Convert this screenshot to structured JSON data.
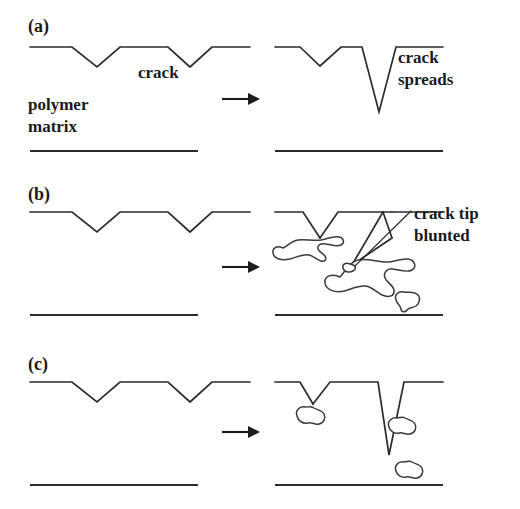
{
  "figure": {
    "background_color": "#ffffff",
    "line_color": "#2b2b2b",
    "text_color": "#1a1a1a",
    "width": 520,
    "height": 509
  },
  "panels": [
    {
      "id": "a",
      "label": "(a)",
      "description": "Unmodified polymer: crack spreads into the matrix",
      "left_labels": [
        "crack",
        "polymer",
        "matrix"
      ],
      "right_labels": [
        "crack",
        "spreads"
      ],
      "has_particles": false
    },
    {
      "id": "b",
      "label": "(b)",
      "description": "Rubber-modified polymer: large particles blunt the crack tip",
      "left_labels": [],
      "right_labels": [
        "crack tip",
        "blunted"
      ],
      "has_particles": true
    },
    {
      "id": "c",
      "label": "(c)",
      "description": "Small rubber particles: crack still spreads",
      "left_labels": [],
      "right_labels": [],
      "has_particles": true
    }
  ],
  "labels": {
    "panel_a": "(a)",
    "panel_b": "(b)",
    "panel_c": "(c)",
    "crack": "crack",
    "polymer": "polymer",
    "matrix": "matrix",
    "crack_spreads_line1": "crack",
    "crack_spreads_line2": "spreads",
    "crack_tip_line1": "crack tip",
    "crack_tip_line2": "blunted"
  },
  "geometry": {
    "surface_profile_left": "30,47 72,47 97,67 120,47 168,47 190,67 212,47 250,47",
    "surface_profile_a_right": "275,47 300,47 320,66 341,47 362,47 379,112 396,47 443,47",
    "baselines": [
      {
        "panel": "a",
        "side": "left",
        "x1": 30,
        "x2": 198,
        "y": 151
      },
      {
        "panel": "a",
        "side": "right",
        "x1": 275,
        "x2": 443,
        "y": 151
      },
      {
        "panel": "b",
        "side": "left",
        "x1": 30,
        "x2": 198,
        "y": 315
      },
      {
        "panel": "b",
        "side": "right",
        "x1": 275,
        "x2": 443,
        "y": 315
      },
      {
        "panel": "c",
        "side": "left",
        "x1": 30,
        "x2": 198,
        "y": 485
      },
      {
        "panel": "c",
        "side": "right",
        "x1": 275,
        "x2": 443,
        "y": 485
      }
    ],
    "arrows": [
      {
        "panel": "a",
        "x1": 222,
        "x2": 252,
        "y": 99
      },
      {
        "panel": "b",
        "x1": 222,
        "x2": 252,
        "y": 267
      },
      {
        "panel": "c",
        "x1": 222,
        "x2": 252,
        "y": 432
      }
    ]
  }
}
